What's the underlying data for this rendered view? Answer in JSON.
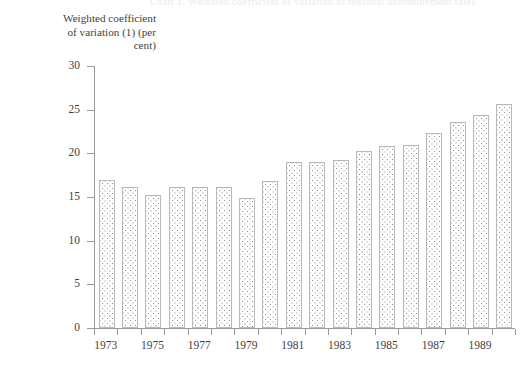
{
  "figure": {
    "title_remnant": "Chart 1. Weighted coefficient of variation of regional unemployment rates",
    "ylabel": "Weighted coefficient\nof variation (1) (per\ncent)",
    "ylabel_lines": [
      "Weighted coefficient",
      "of variation (1) (per",
      "cent)"
    ]
  },
  "chart_data": {
    "type": "bar",
    "title": "",
    "xlabel": "",
    "ylabel": "Weighted coefficient of variation (1) (per cent)",
    "ylim": [
      0,
      30
    ],
    "yticks": [
      0,
      5,
      10,
      15,
      20,
      25,
      30
    ],
    "ytick_labels": [
      "0",
      "5",
      "10",
      "15",
      "20",
      "25",
      "30"
    ],
    "grid": false,
    "legend": "none",
    "categories": [
      "1973",
      "1974",
      "1975",
      "1976",
      "1977",
      "1978",
      "1979",
      "1980",
      "1981",
      "1982",
      "1983",
      "1984",
      "1985",
      "1986",
      "1987",
      "1988",
      "1989",
      "1990"
    ],
    "xtick_labels_shown": [
      "1973",
      "1975",
      "1977",
      "1979",
      "1981",
      "1983",
      "1985",
      "1987",
      "1989"
    ],
    "values": [
      17.0,
      16.2,
      15.2,
      16.2,
      16.1,
      16.1,
      14.9,
      16.8,
      19.0,
      19.0,
      19.2,
      20.3,
      20.8,
      20.9,
      22.3,
      23.6,
      24.4,
      25.7
    ],
    "bar_fill": "dotted-checker",
    "bar_edge_color": "#b9b9b9",
    "bar_dot_color": "#8e8e8e",
    "axis_color": "#9a9a9a",
    "text_color": "#3f3f3f"
  }
}
